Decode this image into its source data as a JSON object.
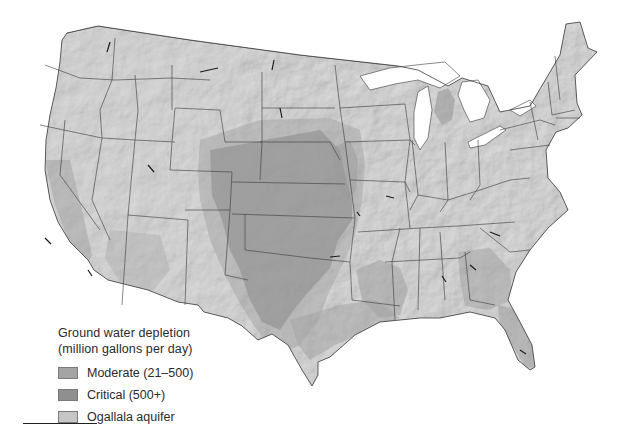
{
  "map": {
    "title": "Ground water depletion in the contiguous United States",
    "colors": {
      "background": "#ffffff",
      "land_base": "#b9b9b9",
      "land_light": "#cfcfcf",
      "moderate": "#a3a3a3",
      "critical": "#8e8e8e",
      "ogallala": "#c4c4c4",
      "lakes": "#ffffff",
      "borders": "#3a3a3a"
    }
  },
  "legend": {
    "title_line1": "Ground water depletion",
    "title_line2": "(million gallons per day)",
    "items": [
      {
        "label": "Moderate (21–500)",
        "color": "#a4a4a4"
      },
      {
        "label": "Critical (500+)",
        "color": "#8f8f8f"
      },
      {
        "label": "Ogallala aquifer",
        "color": "#c6c6c6"
      }
    ]
  }
}
